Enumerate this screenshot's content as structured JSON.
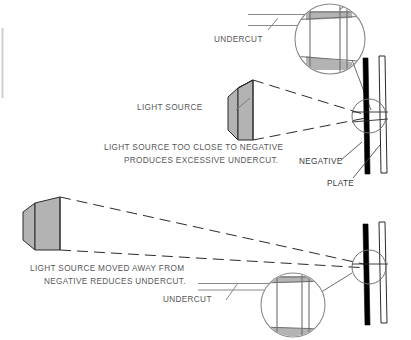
{
  "figure": {
    "title_present": false,
    "background_color": "#ffffff",
    "ink_color": "#58585a",
    "dark_ink_color": "#2b2b2d",
    "fill_gray": "#b3b3b3",
    "light_gray": "#c9c9c9",
    "negative_color": "#000000",
    "plate_color": "#ffffff"
  },
  "labels": {
    "undercut_top": "UNDERCUT",
    "light_source": "LIGHT SOURCE",
    "caption_top_line1": "LIGHT SOURCE TOO CLOSE TO NEGATIVE",
    "caption_top_line2": "PRODUCES EXCESSIVE UNDERCUT.",
    "negative": "NEGATIVE",
    "plate": "PLATE",
    "caption_bottom_line1": "LIGHT SOURCE MOVED AWAY FROM",
    "caption_bottom_line2": "NEGATIVE REDUCES UNDERCUT.",
    "undercut_bottom": "UNDERCUT"
  },
  "diagrams": [
    {
      "id": "top-diagram",
      "name": "light-source-close",
      "caption": "LIGHT SOURCE TOO CLOSE TO NEGATIVE PRODUCES EXCESSIVE UNDERCUT.",
      "light_source_label": "LIGHT SOURCE",
      "detail_circle_label": "UNDERCUT",
      "undercut_severity": "excessive",
      "parts": [
        "light-source-box",
        "light-ray-cone",
        "negative-bar",
        "plate-bar",
        "magnifier-circle",
        "detail-callout-circle"
      ]
    },
    {
      "id": "bottom-diagram",
      "name": "light-source-far",
      "caption": "LIGHT SOURCE MOVED AWAY FROM NEGATIVE REDUCES UNDERCUT.",
      "detail_circle_label": "UNDERCUT",
      "undercut_severity": "reduced",
      "parts": [
        "light-source-box",
        "light-ray-cone",
        "negative-bar",
        "plate-bar",
        "magnifier-circle",
        "detail-callout-circle"
      ]
    }
  ],
  "annotations": {
    "negative_leader": "NEGATIVE",
    "plate_leader": "PLATE"
  }
}
